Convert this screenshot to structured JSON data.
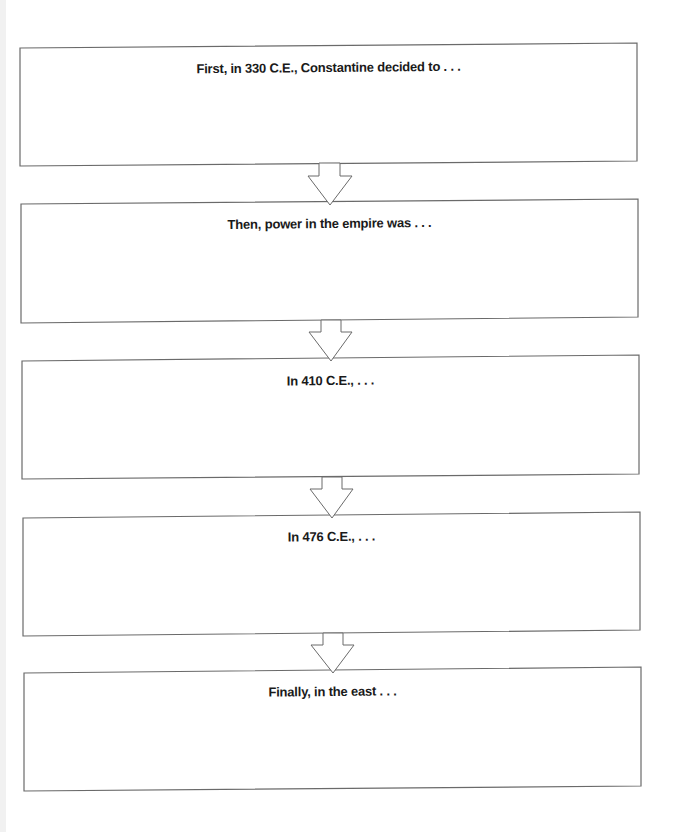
{
  "diagram": {
    "type": "sequence-flowchart",
    "colors": {
      "background": "#ffffff",
      "border": "#6a6a6a",
      "text": "#1a1a1a"
    },
    "boxes": [
      {
        "label": "First, in 330 C.E., Constantine decided to . . .",
        "tl": [
          20,
          48
        ],
        "tr": [
          637,
          43
        ],
        "br": [
          637,
          161
        ],
        "bl": [
          20,
          166
        ],
        "text_top": 60
      },
      {
        "label": "Then, power in the empire was . . .",
        "tl": [
          21,
          204
        ],
        "tr": [
          638,
          199
        ],
        "br": [
          638,
          317
        ],
        "bl": [
          21,
          323
        ],
        "text_top": 216
      },
      {
        "label": "In 410 C.E., . . .",
        "tl": [
          22,
          361
        ],
        "tr": [
          639,
          355
        ],
        "br": [
          639,
          474
        ],
        "bl": [
          22,
          479
        ],
        "text_top": 373
      },
      {
        "label": "In 476 C.E., . . .",
        "tl": [
          23,
          518
        ],
        "tr": [
          640,
          512
        ],
        "br": [
          640,
          630
        ],
        "bl": [
          23,
          636
        ],
        "text_top": 529
      },
      {
        "label": "Finally, in the east . . .",
        "tl": [
          24,
          673
        ],
        "tr": [
          641,
          667
        ],
        "br": [
          641,
          786
        ],
        "bl": [
          24,
          791
        ],
        "text_top": 684
      }
    ],
    "arrows": [
      {
        "from": 1,
        "to": 2,
        "direction": "down"
      },
      {
        "from": 2,
        "to": 3,
        "direction": "down"
      },
      {
        "from": 3,
        "to": 4,
        "direction": "down"
      },
      {
        "from": 4,
        "to": 5,
        "direction": "down"
      }
    ]
  }
}
